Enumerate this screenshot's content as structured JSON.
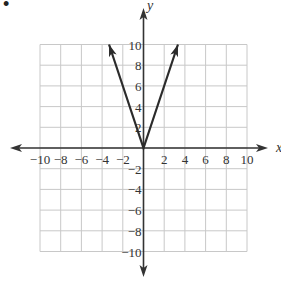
{
  "bullet": "•",
  "chart_data": {
    "type": "line",
    "title": "",
    "xlabel": "x",
    "ylabel": "y",
    "xlim": [
      -10,
      10
    ],
    "ylim": [
      -10,
      10
    ],
    "grid": true,
    "grid_step": 2,
    "x_ticks": [
      -10,
      -8,
      -6,
      -4,
      -2,
      2,
      4,
      6,
      8,
      10
    ],
    "y_ticks": [
      10,
      8,
      6,
      4,
      2,
      -2,
      -4,
      -6,
      -8,
      -10
    ],
    "x_tick_labels": [
      "−10",
      "−8",
      "−6",
      "−4",
      "−2",
      "2",
      "4",
      "6",
      "8",
      "10"
    ],
    "y_tick_labels": [
      "10",
      "8",
      "6",
      "4",
      "2",
      "−2",
      "−4",
      "−6",
      "−8",
      "−10"
    ],
    "series": [
      {
        "name": "y = 3|x|",
        "points": [
          [
            -3.33,
            10
          ],
          [
            0,
            0
          ],
          [
            3.33,
            10
          ]
        ],
        "arrows": "both-ends"
      }
    ],
    "colors": {
      "grid": "#c8c8c8",
      "axis": "#333333",
      "curve": "#2b2b2b"
    }
  }
}
